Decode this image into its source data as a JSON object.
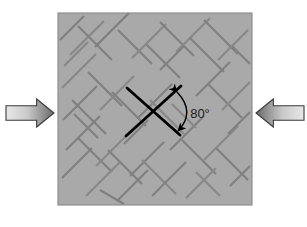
{
  "figure": {
    "background_color": "#ffffff"
  },
  "specimen": {
    "name": "rock-specimen-square",
    "fill_color": "#a9a9a9",
    "border_color": "#8f8f8f",
    "x": 58,
    "y": 13,
    "width": 194,
    "height": 192
  },
  "cracks": {
    "color": "#808080",
    "secondary_color": "#888888",
    "line_width": 2.2,
    "description": "network of conjugate shear cracks at approximately plus and minus 45 degrees",
    "segments": [
      [
        70,
        55,
        104,
        21
      ],
      [
        78,
        26,
        112,
        60
      ],
      [
        95,
        47,
        129,
        13
      ],
      [
        62,
        88,
        96,
        54
      ],
      [
        88,
        72,
        122,
        106
      ],
      [
        118,
        30,
        152,
        64
      ],
      [
        132,
        58,
        166,
        24
      ],
      [
        146,
        44,
        180,
        78
      ],
      [
        160,
        22,
        194,
        56
      ],
      [
        176,
        52,
        210,
        18
      ],
      [
        190,
        38,
        224,
        72
      ],
      [
        204,
        20,
        238,
        54
      ],
      [
        218,
        60,
        248,
        30
      ],
      [
        63,
        120,
        97,
        86
      ],
      [
        72,
        100,
        106,
        134
      ],
      [
        100,
        110,
        134,
        76
      ],
      [
        112,
        92,
        146,
        126
      ],
      [
        138,
        118,
        172,
        84
      ],
      [
        150,
        100,
        184,
        134
      ],
      [
        196,
        96,
        230,
        62
      ],
      [
        208,
        84,
        242,
        118
      ],
      [
        222,
        110,
        250,
        82
      ],
      [
        66,
        150,
        100,
        116
      ],
      [
        78,
        138,
        112,
        172
      ],
      [
        96,
        166,
        130,
        132
      ],
      [
        108,
        150,
        142,
        184
      ],
      [
        130,
        176,
        164,
        142
      ],
      [
        142,
        160,
        176,
        194
      ],
      [
        170,
        150,
        204,
        116
      ],
      [
        182,
        140,
        216,
        174
      ],
      [
        204,
        160,
        238,
        126
      ],
      [
        216,
        148,
        248,
        180
      ],
      [
        62,
        178,
        92,
        148
      ],
      [
        86,
        196,
        120,
        162
      ],
      [
        118,
        200,
        148,
        170
      ],
      [
        152,
        196,
        186,
        162
      ],
      [
        186,
        198,
        216,
        168
      ],
      [
        60,
        40,
        84,
        16
      ],
      [
        228,
        134,
        250,
        112
      ],
      [
        64,
        66,
        88,
        42
      ],
      [
        100,
        190,
        124,
        204
      ],
      [
        160,
        70,
        184,
        46
      ],
      [
        196,
        172,
        220,
        196
      ],
      [
        74,
        114,
        98,
        138
      ],
      [
        124,
        144,
        148,
        120
      ],
      [
        172,
        104,
        196,
        128
      ],
      [
        232,
        46,
        250,
        64
      ],
      [
        230,
        186,
        250,
        166
      ]
    ]
  },
  "crack_planes": {
    "name": "highlighted-conjugate-crack-planes",
    "color": "#000000",
    "line_width": 2.8,
    "plane_a": [
      127,
      88,
      180,
      135
    ],
    "plane_b": [
      126,
      136,
      181,
      86
    ]
  },
  "angle_annotation": {
    "label": "80°",
    "value": 80,
    "unit": "degrees",
    "label_x": 200,
    "label_y": 115,
    "arc_color": "#000000",
    "arc_start_x": 177,
    "arc_start_y": 92,
    "arc_end_x": 178,
    "arc_end_y": 131,
    "arc_control_x": 196,
    "arc_control_y": 112
  },
  "load_arrows": {
    "gradient_light": "#e4e4e4",
    "gradient_dark": "#6e6e6e",
    "outline_color": "#3a3a3a",
    "left": {
      "name": "compression-arrow-left",
      "direction": "right",
      "x": 6,
      "y": 99,
      "width": 48,
      "height": 28
    },
    "right": {
      "name": "compression-arrow-right",
      "direction": "left",
      "x": 256,
      "y": 99,
      "width": 48,
      "height": 28
    }
  }
}
